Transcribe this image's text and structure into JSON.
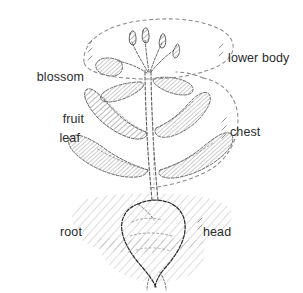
{
  "figure": {
    "background_color": "#ffffff",
    "ink_color": "#3a3a3a",
    "text_color": "#2b2b2b",
    "width": 303,
    "height": 293
  },
  "labels": {
    "blossom_fruit": "blossom\nfruit",
    "blossom": "blossom",
    "fruit": "fruit",
    "lower_body": "lower body",
    "leaf": "leaf",
    "chest": "chest",
    "root": "root",
    "head": "head"
  },
  "regions": [
    {
      "name": "upper-region",
      "plant_part": "blossom / fruit",
      "body_part": "lower body",
      "outline": "dashed-ellipse",
      "left_label": "blossom\nfruit",
      "right_label": "lower body"
    },
    {
      "name": "middle-region",
      "plant_part": "leaf",
      "body_part": "chest",
      "outline": "dashed-lobe",
      "left_label": "leaf",
      "right_label": "chest"
    },
    {
      "name": "lower-region",
      "plant_part": "root",
      "body_part": "head",
      "outline": "hatched-soil",
      "left_label": "root",
      "right_label": "head"
    }
  ],
  "drawing_elements": [
    "flower-buds",
    "main-stem",
    "upper-leaf-pair",
    "lower-leaf-pair",
    "taproot",
    "soil-hatching",
    "dashed-upper-outline",
    "dashed-middle-outline"
  ]
}
